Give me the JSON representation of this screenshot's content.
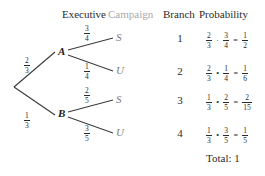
{
  "headers": {
    "executive": "Executive",
    "campaign": "Campaign",
    "branch": "Branch",
    "probability": "Probability"
  },
  "tree": {
    "root_edges": [
      {
        "label_num": "2",
        "label_den": "3",
        "target": "A"
      },
      {
        "label_num": "1",
        "label_den": "3",
        "target": "B"
      }
    ],
    "nodes": [
      {
        "id": "A",
        "label": "A"
      },
      {
        "id": "B",
        "label": "B"
      }
    ],
    "leaf_edges": [
      {
        "from": "A",
        "label_num": "3",
        "label_den": "4",
        "leaf": "S"
      },
      {
        "from": "A",
        "label_num": "1",
        "label_den": "4",
        "leaf": "U"
      },
      {
        "from": "B",
        "label_num": "2",
        "label_den": "5",
        "leaf": "S"
      },
      {
        "from": "B",
        "label_num": "3",
        "label_den": "5",
        "leaf": "U"
      }
    ],
    "leaves": [
      {
        "label": "S"
      },
      {
        "label": "U"
      },
      {
        "label": "S"
      },
      {
        "label": "U"
      }
    ]
  },
  "rows": [
    {
      "branch": "1",
      "f1_num": "2",
      "f1_den": "3",
      "op": "·",
      "f2_num": "3",
      "f2_den": "4",
      "eq": "=",
      "r_num": "1",
      "r_den": "2"
    },
    {
      "branch": "2",
      "f1_num": "2",
      "f1_den": "3",
      "op": "•",
      "f2_num": "1",
      "f2_den": "4",
      "eq": "=",
      "r_num": "1",
      "r_den": "6"
    },
    {
      "branch": "3",
      "f1_num": "1",
      "f1_den": "3",
      "op": "•",
      "f2_num": "2",
      "f2_den": "5",
      "eq": "=",
      "r_num": "2",
      "r_den": "15"
    },
    {
      "branch": "4",
      "f1_num": "1",
      "f1_den": "3",
      "op": "•",
      "f2_num": "3",
      "f2_den": "5",
      "eq": "=",
      "r_num": "1",
      "r_den": "5"
    }
  ],
  "total": {
    "text": "Total: 1"
  },
  "colors": {
    "ink": "#1a1a1a",
    "muted": "#7d7d7d",
    "faded_header": "#a9a9a9",
    "line": "#3a3a3a",
    "background": "#ffffff"
  }
}
